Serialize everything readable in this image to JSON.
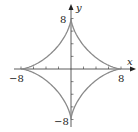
{
  "chart_data": {
    "type": "line",
    "title": "",
    "xlabel": "x",
    "ylabel": "y",
    "xlim": [
      -8,
      8
    ],
    "ylim": [
      -8,
      8
    ],
    "grid": false,
    "equation": "x^(2/3) + y^(2/3) = 8^(2/3)",
    "x_tick_labels": [
      "-8",
      "8"
    ],
    "y_tick_labels": [
      "8",
      "-8"
    ],
    "tick_spacing": 2,
    "series": [
      {
        "name": "astroid",
        "color": "#8a8a8a",
        "points": [
          [
            8,
            0
          ],
          [
            5.6,
            0.3
          ],
          [
            4,
            1
          ],
          [
            2.8,
            1.9
          ],
          [
            1,
            4
          ],
          [
            0.3,
            5.6
          ],
          [
            0,
            8
          ],
          [
            -0.3,
            5.6
          ],
          [
            -1,
            4
          ],
          [
            -2.8,
            1.9
          ],
          [
            -4,
            1
          ],
          [
            -5.6,
            0.3
          ],
          [
            -8,
            0
          ],
          [
            -5.6,
            -0.3
          ],
          [
            -4,
            -1
          ],
          [
            -2.8,
            -1.9
          ],
          [
            -1,
            -4
          ],
          [
            -0.3,
            -5.6
          ],
          [
            0,
            -8
          ],
          [
            0.3,
            -5.6
          ],
          [
            1,
            -4
          ],
          [
            2.8,
            -1.9
          ],
          [
            4,
            -1
          ],
          [
            5.6,
            -0.3
          ],
          [
            8,
            0
          ]
        ]
      }
    ]
  },
  "labels": {
    "x_axis": "x",
    "y_axis": "y",
    "x_min": "−8",
    "x_max": "8",
    "y_max": "8",
    "y_min": "−8"
  }
}
